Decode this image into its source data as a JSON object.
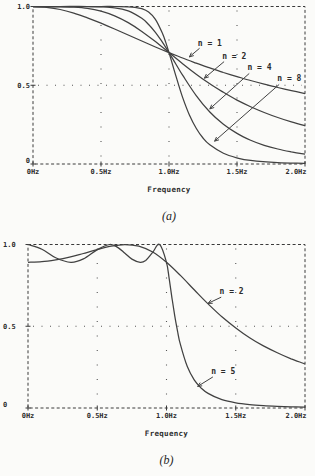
{
  "page": {
    "background": "#fbfbf9",
    "ink": "#2c2c2c"
  },
  "chart_data": [
    {
      "id": "a",
      "type": "line",
      "caption": "(a)",
      "xlabel": "Frequency",
      "xlim": [
        0,
        2
      ],
      "ylim": [
        0,
        1
      ],
      "xticks": [
        {
          "v": 0,
          "label": "0Hz"
        },
        {
          "v": 0.5,
          "label": "0.5Hz"
        },
        {
          "v": 1,
          "label": "1.0Hz"
        },
        {
          "v": 1.5,
          "label": "1.5Hz"
        },
        {
          "v": 2,
          "label": "2.0Hz"
        }
      ],
      "yticks": [
        {
          "v": 0,
          "label": "0"
        },
        {
          "v": 0.5,
          "label": "0.5"
        },
        {
          "v": 1,
          "label": "1.0"
        }
      ],
      "grid_x": [
        0.5,
        1,
        1.5
      ],
      "grid_y": [
        0.5
      ],
      "axis_color": "#3a3a3a",
      "grid_color": "#555555",
      "line_color": "#414141",
      "legend_position": "none",
      "series": [
        {
          "name": "n = 1",
          "x": [
            0,
            0.1,
            0.2,
            0.3,
            0.4,
            0.5,
            0.6,
            0.7,
            0.8,
            0.9,
            1,
            1.1,
            1.2,
            1.3,
            1.4,
            1.5,
            1.6,
            1.7,
            1.8,
            1.9,
            2
          ],
          "y": [
            1,
            0.995,
            0.981,
            0.958,
            0.928,
            0.894,
            0.857,
            0.819,
            0.781,
            0.743,
            0.707,
            0.673,
            0.64,
            0.61,
            0.581,
            0.555,
            0.53,
            0.507,
            0.486,
            0.466,
            0.447
          ]
        },
        {
          "name": "n = 2",
          "x": [
            0,
            0.1,
            0.2,
            0.3,
            0.4,
            0.5,
            0.6,
            0.7,
            0.8,
            0.9,
            1,
            1.1,
            1.2,
            1.3,
            1.4,
            1.5,
            1.6,
            1.7,
            1.8,
            1.9,
            2
          ],
          "y": [
            1,
            1,
            0.999,
            0.996,
            0.988,
            0.97,
            0.941,
            0.898,
            0.842,
            0.777,
            0.707,
            0.637,
            0.57,
            0.509,
            0.455,
            0.406,
            0.364,
            0.327,
            0.295,
            0.267,
            0.243
          ]
        },
        {
          "name": "n = 4",
          "x": [
            0,
            0.2,
            0.4,
            0.5,
            0.6,
            0.7,
            0.8,
            0.85,
            0.9,
            0.95,
            1,
            1.05,
            1.1,
            1.2,
            1.3,
            1.4,
            1.5,
            1.6,
            1.7,
            1.8,
            1.9,
            2
          ],
          "y": [
            1,
            1,
            1,
            0.998,
            0.992,
            0.972,
            0.925,
            0.886,
            0.836,
            0.775,
            0.707,
            0.635,
            0.564,
            0.434,
            0.33,
            0.252,
            0.194,
            0.151,
            0.119,
            0.095,
            0.077,
            0.062
          ]
        },
        {
          "name": "n = 8",
          "x": [
            0,
            0.3,
            0.5,
            0.6,
            0.7,
            0.75,
            0.8,
            0.85,
            0.9,
            0.95,
            0.975,
            1,
            1.025,
            1.05,
            1.1,
            1.15,
            1.2,
            1.25,
            1.3,
            1.4,
            1.5,
            1.6,
            1.8,
            2
          ],
          "y": [
            1,
            1,
            1,
            1,
            0.998,
            0.995,
            0.986,
            0.965,
            0.919,
            0.833,
            0.775,
            0.707,
            0.634,
            0.561,
            0.423,
            0.311,
            0.227,
            0.165,
            0.122,
            0.068,
            0.039,
            0.023,
            0.009,
            0.004
          ]
        }
      ],
      "annotations": [
        {
          "text": "n = 1",
          "label_x": 1.3,
          "label_y": 0.765,
          "tail_x": 1.225,
          "tail_y": 0.735,
          "tip_x": 1.15,
          "tip_y": 0.68
        },
        {
          "text": "n = 2",
          "label_x": 1.48,
          "label_y": 0.685,
          "tail_x": 1.405,
          "tail_y": 0.65,
          "tip_x": 1.26,
          "tip_y": 0.545
        },
        {
          "text": "n = 4",
          "label_x": 1.665,
          "label_y": 0.61,
          "tail_x": 1.59,
          "tail_y": 0.575,
          "tip_x": 1.3,
          "tip_y": 0.35
        },
        {
          "text": "n = 8",
          "label_x": 1.885,
          "label_y": 0.54,
          "tail_x": 1.81,
          "tail_y": 0.505,
          "tip_x": 1.335,
          "tip_y": 0.145
        }
      ]
    },
    {
      "id": "b",
      "type": "line",
      "caption": "(b)",
      "xlabel": "Frequency",
      "xlim": [
        0,
        2
      ],
      "ylim": [
        0,
        1
      ],
      "xticks": [
        {
          "v": 0,
          "label": "0Hz"
        },
        {
          "v": 0.5,
          "label": "0.5Hz"
        },
        {
          "v": 1,
          "label": "1.0Hz"
        },
        {
          "v": 1.5,
          "label": "1.5Hz"
        },
        {
          "v": 2,
          "label": "2.0Hz"
        }
      ],
      "yticks": [
        {
          "v": 0,
          "label": "0"
        },
        {
          "v": 0.5,
          "label": "0.5"
        },
        {
          "v": 1,
          "label": "1.0"
        }
      ],
      "grid_x": [
        0.5,
        1,
        1.5
      ],
      "grid_y": [
        0.5
      ],
      "axis_color": "#3a3a3a",
      "grid_color": "#555555",
      "line_color": "#414141",
      "legend_position": "none",
      "series": [
        {
          "name": "n = 2",
          "x": [
            0,
            0.1,
            0.2,
            0.3,
            0.4,
            0.5,
            0.6,
            0.7,
            0.8,
            0.9,
            1,
            1.1,
            1.2,
            1.3,
            1.4,
            1.5,
            1.6,
            1.7,
            1.8,
            1.9,
            2
          ],
          "y": [
            0.891,
            0.895,
            0.906,
            0.923,
            0.945,
            0.969,
            0.99,
            1,
            0.99,
            0.954,
            0.891,
            0.811,
            0.723,
            0.637,
            0.558,
            0.49,
            0.43,
            0.38,
            0.338,
            0.301,
            0.27
          ]
        },
        {
          "name": "n = 5",
          "x": [
            0,
            0.1,
            0.2,
            0.31,
            0.4,
            0.5,
            0.59,
            0.65,
            0.7,
            0.75,
            0.81,
            0.85,
            0.9,
            0.95,
            1,
            1.02,
            1.04,
            1.06,
            1.08,
            1.1,
            1.15,
            1.2,
            1.25,
            1.3,
            1.4,
            1.5,
            1.6,
            1.7,
            1.8,
            1.9,
            2
          ],
          "y": [
            1,
            0.971,
            0.919,
            0.891,
            0.912,
            0.969,
            1,
            0.981,
            0.946,
            0.911,
            0.891,
            0.903,
            0.952,
            1,
            0.891,
            0.787,
            0.671,
            0.562,
            0.468,
            0.389,
            0.253,
            0.172,
            0.122,
            0.089,
            0.051,
            0.032,
            0.021,
            0.014,
            0.01,
            0.007,
            0.005
          ]
        }
      ],
      "annotations": [
        {
          "text": "n = 2",
          "label_x": 1.47,
          "label_y": 0.715,
          "tail_x": 1.395,
          "tail_y": 0.678,
          "tip_x": 1.3,
          "tip_y": 0.64
        },
        {
          "text": "n = 5",
          "label_x": 1.41,
          "label_y": 0.225,
          "tail_x": 1.335,
          "tail_y": 0.19,
          "tip_x": 1.225,
          "tip_y": 0.132
        }
      ]
    }
  ]
}
